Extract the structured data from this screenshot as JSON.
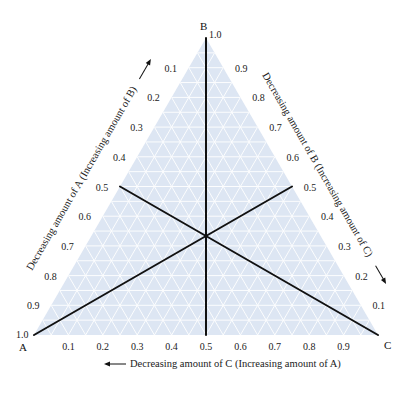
{
  "diagram": {
    "type": "ternary",
    "fill_color": "#dde6f3",
    "grid_color": "#ffffff",
    "line_color": "#111111",
    "vertices": {
      "A": {
        "label": "A",
        "value_label": "1.0"
      },
      "B": {
        "label": "B",
        "value_label": "1.0"
      },
      "C": {
        "label": "C"
      }
    },
    "bottom_axis": {
      "ticks": [
        "0.1",
        "0.2",
        "0.3",
        "0.4",
        "0.5",
        "0.6",
        "0.7",
        "0.8",
        "0.9"
      ],
      "title": "Decreasing amount of C (Increasing amount of A)",
      "arrow_direction": "left"
    },
    "left_axis": {
      "ticks": [
        "0.1",
        "0.2",
        "0.3",
        "0.4",
        "0.5",
        "0.6",
        "0.7",
        "0.8",
        "0.9"
      ],
      "title": "Decreasing amount of A (Increasing amount of B)",
      "arrow_direction": "up-right"
    },
    "right_axis": {
      "ticks": [
        "0.9",
        "0.8",
        "0.7",
        "0.6",
        "0.5",
        "0.4",
        "0.3",
        "0.2",
        "0.1"
      ],
      "title": "Decreasing amount of B (Increasing amount of C)",
      "arrow_direction": "down-right"
    },
    "median_lines": [
      {
        "from": "A",
        "to": "midpoint BC (0.5)"
      },
      {
        "from": "B",
        "to": "midpoint AC (0.5)"
      },
      {
        "from": "C",
        "to": "midpoint AB (0.5)"
      }
    ]
  }
}
